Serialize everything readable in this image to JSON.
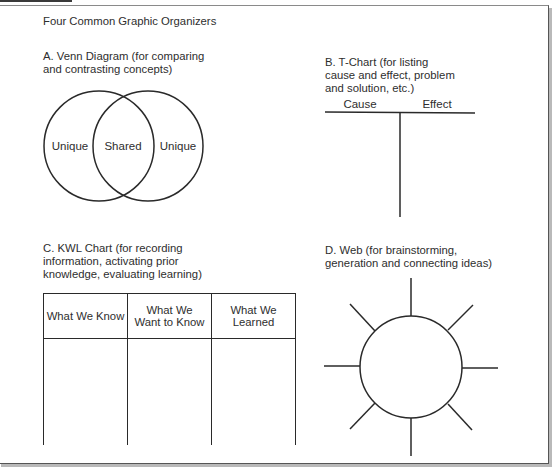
{
  "page_title": "Four Common Graphic Organizers",
  "sections": {
    "venn": {
      "caption": "A. Venn Diagram (for comparing\nand contrasting concepts)",
      "labels": {
        "left": "Unique",
        "middle": "Shared",
        "right": "Unique"
      }
    },
    "tchart": {
      "caption": "B. T-Chart (for listing\ncause and effect, problem\nand solution, etc.)",
      "columns": [
        "Cause",
        "Effect"
      ]
    },
    "kwl": {
      "caption": "C. KWL Chart (for recording\ninformation, activating prior\nknowledge, evaluating learning)",
      "columns": [
        "What We Know",
        "What We\nWant to Know",
        "What We\nLearned"
      ]
    },
    "web": {
      "caption": "D. Web (for brainstorming,\ngeneration and connecting ideas)",
      "spokes": 8
    }
  }
}
